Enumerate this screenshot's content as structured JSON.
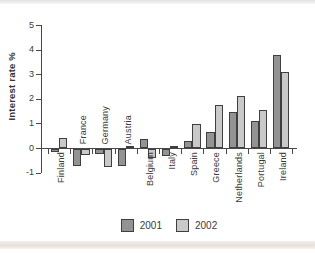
{
  "chart_data": {
    "type": "bar",
    "title": "",
    "ylabel": "Interest rate %",
    "xlabel": "",
    "categories": [
      "Finland",
      "France",
      "Germany",
      "Austria",
      "Belgium",
      "Italy",
      "Spain",
      "Greece",
      "Netherlands",
      "Portugal",
      "Ireland"
    ],
    "series": [
      {
        "name": "2001",
        "values": [
          -0.1,
          -0.7,
          -0.2,
          -0.7,
          0.35,
          -0.3,
          0.3,
          0.65,
          1.45,
          1.1,
          3.8
        ]
      },
      {
        "name": "2002",
        "values": [
          0.4,
          -0.25,
          -0.75,
          0.1,
          -0.35,
          0.1,
          1.0,
          1.75,
          2.1,
          1.55,
          3.1
        ]
      }
    ],
    "ylim": [
      -1,
      5
    ],
    "yticks": [
      5,
      4,
      3,
      2,
      1,
      0,
      -1
    ],
    "grid": false,
    "legend_position": "bottom",
    "labels_above_axis": [
      "France",
      "Germany",
      "Austria"
    ],
    "colors": {
      "2001": "#939393",
      "2002": "#c9c9c9",
      "border": "#3f3f3f"
    }
  }
}
